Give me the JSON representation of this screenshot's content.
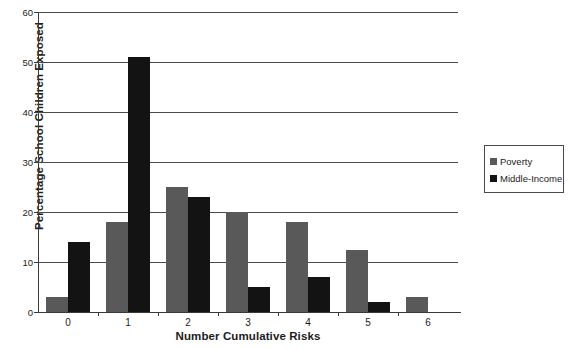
{
  "chart_data": {
    "type": "bar",
    "title": "",
    "xlabel": "Number Cumulative Risks",
    "ylabel": "Percentage School Children Exposed",
    "categories": [
      "0",
      "1",
      "2",
      "3",
      "4",
      "5",
      "6"
    ],
    "series": [
      {
        "name": "Poverty",
        "color": "#595959",
        "values": [
          3,
          18,
          25,
          20,
          18,
          12.5,
          3
        ]
      },
      {
        "name": "Middle-Income",
        "color": "#131313",
        "values": [
          14,
          51,
          23,
          5,
          7,
          2,
          0
        ]
      }
    ],
    "ylim": [
      0,
      60
    ],
    "ytick_labels": [
      "0",
      "10",
      "20",
      "30",
      "40",
      "50",
      "60"
    ],
    "ytick_values": [
      0,
      10,
      20,
      30,
      40,
      50,
      60
    ],
    "grid": true,
    "legend_position": "right"
  }
}
